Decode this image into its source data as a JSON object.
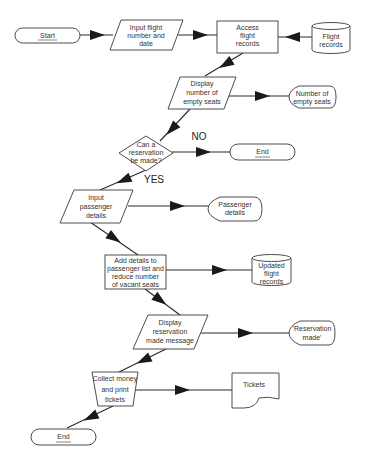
{
  "diagram": {
    "type": "flowchart",
    "title": "",
    "colors": {
      "stroke": "#3a3a3a",
      "arrow": "#1a1a1a",
      "fill": "#ffffff",
      "text": "#333333"
    },
    "nodes": [
      {
        "id": "start",
        "shape": "terminator",
        "lines": [
          "Start"
        ]
      },
      {
        "id": "input-flight",
        "shape": "parallelogram",
        "lines": [
          "Input flight",
          "number and",
          "date"
        ]
      },
      {
        "id": "access-records",
        "shape": "process",
        "lines": [
          "Access",
          "flight",
          "records"
        ]
      },
      {
        "id": "flight-records",
        "shape": "database",
        "lines": [
          "Flight",
          "records"
        ]
      },
      {
        "id": "display-empty",
        "shape": "parallelogram",
        "lines": [
          "Display",
          "number of",
          "empty seats"
        ]
      },
      {
        "id": "empty-seats-out",
        "shape": "display",
        "lines": [
          "Number of",
          "empty seats"
        ]
      },
      {
        "id": "decision",
        "shape": "decision",
        "lines": [
          "Can a",
          "reservation",
          "be made?"
        ]
      },
      {
        "id": "end-mid",
        "shape": "terminator",
        "lines": [
          "End"
        ]
      },
      {
        "id": "input-passenger",
        "shape": "parallelogram",
        "lines": [
          "Input",
          "passenger",
          "details"
        ]
      },
      {
        "id": "passenger-out",
        "shape": "display",
        "lines": [
          "Passenger",
          "details"
        ]
      },
      {
        "id": "add-details",
        "shape": "process",
        "lines": [
          "Add details to",
          "passenger list and",
          "reduce number",
          "of vacant seats"
        ]
      },
      {
        "id": "updated-records",
        "shape": "database",
        "lines": [
          "Updated",
          "flight",
          "records"
        ]
      },
      {
        "id": "display-reservation",
        "shape": "parallelogram",
        "lines": [
          "Display",
          "reservation",
          "made message"
        ]
      },
      {
        "id": "reservation-out",
        "shape": "display",
        "lines": [
          "'Reservation",
          "made'"
        ]
      },
      {
        "id": "collect-money",
        "shape": "manual-operation",
        "lines": [
          "Collect money",
          "and print",
          "tickets"
        ]
      },
      {
        "id": "tickets",
        "shape": "document",
        "lines": [
          "Tickets"
        ]
      },
      {
        "id": "end-bottom",
        "shape": "terminator",
        "lines": [
          "End"
        ]
      }
    ],
    "branch_labels": {
      "no": "NO",
      "yes": "YES"
    },
    "edges": [
      {
        "from": "start",
        "to": "input-flight"
      },
      {
        "from": "input-flight",
        "to": "access-records"
      },
      {
        "from": "flight-records",
        "to": "access-records"
      },
      {
        "from": "access-records",
        "to": "display-empty"
      },
      {
        "from": "display-empty",
        "to": "empty-seats-out"
      },
      {
        "from": "display-empty",
        "to": "decision"
      },
      {
        "from": "decision",
        "to": "end-mid",
        "label": "NO"
      },
      {
        "from": "decision",
        "to": "input-passenger",
        "label": "YES"
      },
      {
        "from": "input-passenger",
        "to": "passenger-out"
      },
      {
        "from": "input-passenger",
        "to": "add-details"
      },
      {
        "from": "add-details",
        "to": "updated-records"
      },
      {
        "from": "add-details",
        "to": "display-reservation"
      },
      {
        "from": "display-reservation",
        "to": "reservation-out"
      },
      {
        "from": "display-reservation",
        "to": "collect-money"
      },
      {
        "from": "collect-money",
        "to": "tickets"
      },
      {
        "from": "collect-money",
        "to": "end-bottom"
      }
    ]
  }
}
